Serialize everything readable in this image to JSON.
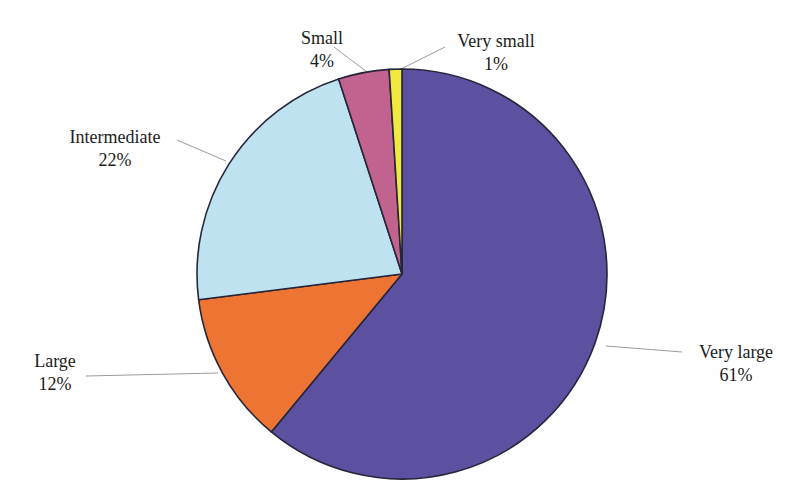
{
  "chart_data": {
    "type": "pie",
    "title": "",
    "categories": [
      "Very large",
      "Large",
      "Intermediate",
      "Small",
      "Very small"
    ],
    "values": [
      61,
      12,
      22,
      4,
      1
    ],
    "slices": [
      {
        "label": "Very large",
        "pct": 61,
        "pct_label": "61%",
        "color": "#5b51a0"
      },
      {
        "label": "Large",
        "pct": 12,
        "pct_label": "12%",
        "color": "#ee7434"
      },
      {
        "label": "Intermediate",
        "pct": 22,
        "pct_label": "22%",
        "color": "#bfe2f1"
      },
      {
        "label": "Small",
        "pct": 4,
        "pct_label": "4%",
        "color": "#c2628e"
      },
      {
        "label": "Very small",
        "pct": 1,
        "pct_label": "1%",
        "color": "#f2e93f"
      }
    ],
    "start_angle_deg": 0,
    "direction": "clockwise",
    "stroke_color": "#26263a",
    "leader_line_color": "#9b9b9b",
    "legend_position": "none",
    "labels_outside_with_leader_lines": true
  }
}
